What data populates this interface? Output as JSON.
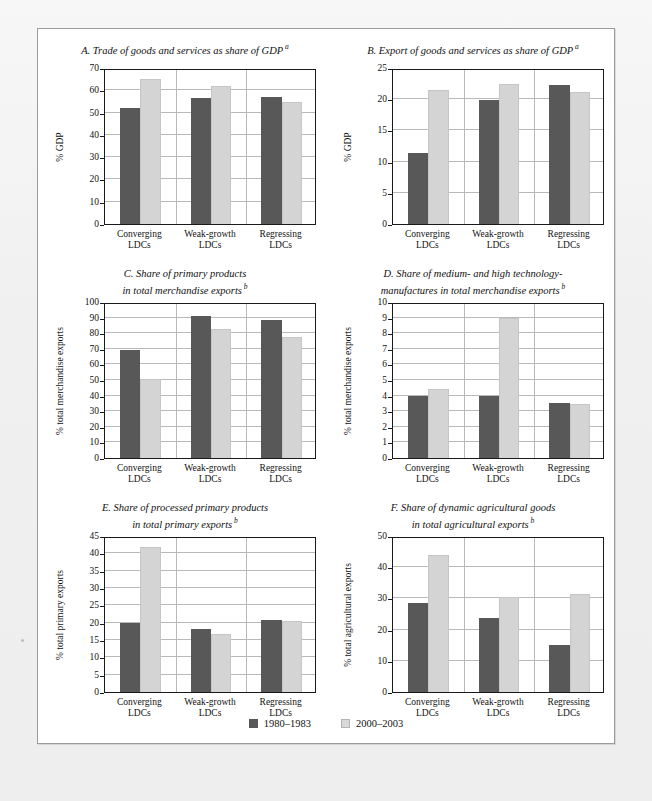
{
  "figure": {
    "background_color": "#f2f2f2",
    "panel_color": "#ffffff",
    "series_colors": {
      "period1": "#585858",
      "period2": "#d4d4d4"
    }
  },
  "legend": {
    "items": [
      {
        "label": "1980–1983",
        "color": "#585858"
      },
      {
        "label": "2000–2003",
        "color": "#d4d4d4"
      }
    ]
  },
  "categories": [
    "Converging\nLDCs",
    "Weak-growth\nLDCs",
    "Regressing\nLDCs"
  ],
  "chart_data": [
    {
      "id": "A",
      "type": "bar",
      "title": "A. Trade of goods and services as share of GDP",
      "title_line2": "",
      "title_note": "a",
      "ylabel": "% GDP",
      "xlabel": "",
      "categories": [
        "Converging LDCs",
        "Weak-growth LDCs",
        "Regressing LDCs"
      ],
      "ylim": [
        0,
        70
      ],
      "yticks": [
        0,
        10,
        20,
        30,
        40,
        50,
        60,
        70
      ],
      "grid": true,
      "legend_position": "bottom",
      "series": [
        {
          "name": "1980–1983",
          "values": [
            52.2,
            56.5,
            56.8
          ]
        },
        {
          "name": "2000–2003",
          "values": [
            65.0,
            62.0,
            54.8
          ]
        }
      ]
    },
    {
      "id": "B",
      "type": "bar",
      "title": "B. Export of goods and services as share of GDP",
      "title_line2": "",
      "title_note": "a",
      "ylabel": "% GDP",
      "xlabel": "",
      "categories": [
        "Converging LDCs",
        "Weak-growth LDCs",
        "Regressing LDCs"
      ],
      "ylim": [
        0,
        25
      ],
      "yticks": [
        0,
        5,
        10,
        15,
        20,
        25
      ],
      "grid": true,
      "legend_position": "bottom",
      "series": [
        {
          "name": "1980–1983",
          "values": [
            11.4,
            19.8,
            22.2
          ]
        },
        {
          "name": "2000–2003",
          "values": [
            21.5,
            22.5,
            21.2
          ]
        }
      ]
    },
    {
      "id": "C",
      "type": "bar",
      "title": "C. Share of primary products",
      "title_line2": "in total merchandise exports",
      "title_note": "b",
      "ylabel": "% total merchandise exports",
      "xlabel": "",
      "categories": [
        "Converging LDCs",
        "Weak-growth LDCs",
        "Regressing LDCs"
      ],
      "ylim": [
        0,
        100
      ],
      "yticks": [
        0,
        10,
        20,
        30,
        40,
        50,
        60,
        70,
        80,
        90,
        100
      ],
      "grid": true,
      "legend_position": "bottom",
      "series": [
        {
          "name": "1980–1983",
          "values": [
            69.0,
            91.0,
            88.5
          ]
        },
        {
          "name": "2000–2003",
          "values": [
            50.5,
            82.5,
            77.5
          ]
        }
      ]
    },
    {
      "id": "D",
      "type": "bar",
      "title": "D. Share of medium- and high technology-",
      "title_line2": "manufactures in total merchandise exports",
      "title_note": "b",
      "ylabel": "% total merchandise exports",
      "xlabel": "",
      "categories": [
        "Converging LDCs",
        "Weak-growth LDCs",
        "Regressing LDCs"
      ],
      "ylim": [
        0,
        10
      ],
      "yticks": [
        0,
        1,
        2,
        3,
        4,
        5,
        6,
        7,
        8,
        9,
        10
      ],
      "grid": true,
      "legend_position": "bottom",
      "series": [
        {
          "name": "1980–1983",
          "values": [
            4.0,
            4.0,
            3.55
          ]
        },
        {
          "name": "2000–2003",
          "values": [
            4.45,
            9.0,
            3.48
          ]
        }
      ]
    },
    {
      "id": "E",
      "type": "bar",
      "title": "E. Share of processed primary products",
      "title_line2": "in total primary exports",
      "title_note": "b",
      "ylabel": "% total primary exports",
      "xlabel": "",
      "categories": [
        "Converging LDCs",
        "Weak-growth LDCs",
        "Regressing LDCs"
      ],
      "ylim": [
        0,
        45
      ],
      "yticks": [
        0,
        5,
        10,
        15,
        20,
        25,
        30,
        35,
        40,
        45
      ],
      "grid": true,
      "legend_position": "bottom",
      "series": [
        {
          "name": "1980–1983",
          "values": [
            19.8,
            18.1,
            20.9
          ]
        },
        {
          "name": "2000–2003",
          "values": [
            41.8,
            16.6,
            20.6
          ]
        }
      ]
    },
    {
      "id": "F",
      "type": "bar",
      "title": "F. Share of dynamic agricultural goods",
      "title_line2": "in total agricultural exports",
      "title_note": "b",
      "ylabel": "% total agricultural exports",
      "xlabel": "",
      "categories": [
        "Converging LDCs",
        "Weak-growth LDCs",
        "Regressing LDCs"
      ],
      "ylim": [
        0,
        50
      ],
      "yticks": [
        0,
        10,
        20,
        30,
        40,
        50
      ],
      "grid": true,
      "legend_position": "bottom",
      "series": [
        {
          "name": "1980–1983",
          "values": [
            28.4,
            23.6,
            15.2
          ]
        },
        {
          "name": "2000–2003",
          "values": [
            43.8,
            30.5,
            31.4
          ]
        }
      ]
    }
  ]
}
